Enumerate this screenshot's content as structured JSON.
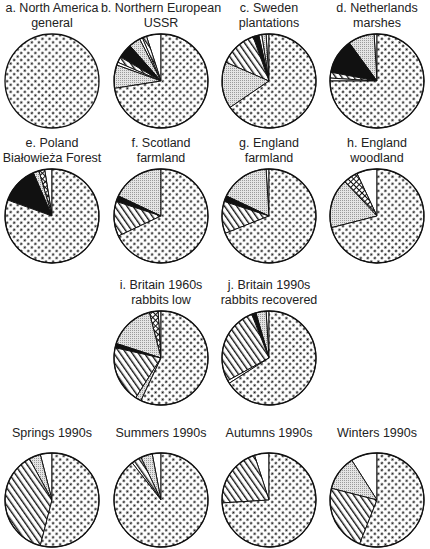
{
  "figure": {
    "legend_note": "Pie segments distinguished by fill pattern only; no legend shown in image.",
    "patterns": {
      "dots": "dense dot stipple (dominant category)",
      "fine": "fine grey stipple",
      "hatch": "diagonal hatch",
      "black": "solid black",
      "cross": "cross-hatch",
      "white": "plain white"
    }
  },
  "chart_data": {
    "type": "pie",
    "title": "",
    "layout": "grid of small-multiple pie charts; slices listed counter-clockwise from 12 o'clock, dotted slice completing the circle clockwise",
    "pies": [
      {
        "id": "a",
        "title_line1": "a. North America",
        "title_line2": "general",
        "cx": 52,
        "cy": 81,
        "slices": [
          {
            "pattern": "dots",
            "value": 100
          }
        ]
      },
      {
        "id": "b",
        "title_line1": "b. Northern European",
        "title_line2": "USSR",
        "cx": 161,
        "cy": 81,
        "slices": [
          {
            "pattern": "white",
            "value": 5
          },
          {
            "pattern": "hatch",
            "value": 1.5
          },
          {
            "pattern": "white",
            "value": 1
          },
          {
            "pattern": "fine",
            "value": 4
          },
          {
            "pattern": "black",
            "value": 5
          },
          {
            "pattern": "hatch",
            "value": 2
          },
          {
            "pattern": "white",
            "value": 1
          },
          {
            "pattern": "fine",
            "value": 8
          },
          {
            "pattern": "dots",
            "value": 72.5
          }
        ]
      },
      {
        "id": "c",
        "title_line1": "c. Sweden",
        "title_line2": "plantations",
        "cx": 269,
        "cy": 81,
        "slices": [
          {
            "pattern": "white",
            "value": 1
          },
          {
            "pattern": "fine",
            "value": 1.5
          },
          {
            "pattern": "white",
            "value": 1
          },
          {
            "pattern": "black",
            "value": 2
          },
          {
            "pattern": "hatch",
            "value": 13
          },
          {
            "pattern": "fine",
            "value": 16
          },
          {
            "pattern": "dots",
            "value": 65.5
          }
        ]
      },
      {
        "id": "d",
        "title_line1": "d. Netherlands",
        "title_line2": "marshes",
        "cx": 377,
        "cy": 81,
        "slices": [
          {
            "pattern": "white",
            "value": 1
          },
          {
            "pattern": "fine",
            "value": 9
          },
          {
            "pattern": "black",
            "value": 12
          },
          {
            "pattern": "hatch",
            "value": 2
          },
          {
            "pattern": "white",
            "value": 1
          },
          {
            "pattern": "dots",
            "value": 75
          }
        ]
      },
      {
        "id": "e",
        "title_line1": "e. Poland",
        "title_line2": "Białowieża Forest",
        "cx": 52,
        "cy": 216,
        "slices": [
          {
            "pattern": "white",
            "value": 2.5
          },
          {
            "pattern": "cross",
            "value": 2
          },
          {
            "pattern": "fine",
            "value": 2
          },
          {
            "pattern": "black",
            "value": 13
          },
          {
            "pattern": "dots",
            "value": 80.5
          }
        ]
      },
      {
        "id": "f",
        "title_line1": "f. Scotland",
        "title_line2": "farmland",
        "cx": 161,
        "cy": 216,
        "slices": [
          {
            "pattern": "fine",
            "value": 18
          },
          {
            "pattern": "black",
            "value": 2
          },
          {
            "pattern": "hatch",
            "value": 12
          },
          {
            "pattern": "dots",
            "value": 68
          }
        ]
      },
      {
        "id": "g",
        "title_line1": "g. England",
        "title_line2": "farmland",
        "cx": 269,
        "cy": 216,
        "slices": [
          {
            "pattern": "white",
            "value": 1
          },
          {
            "pattern": "fine",
            "value": 17
          },
          {
            "pattern": "black",
            "value": 2
          },
          {
            "pattern": "hatch",
            "value": 11
          },
          {
            "pattern": "dots",
            "value": 69
          }
        ]
      },
      {
        "id": "h",
        "title_line1": "h. England",
        "title_line2": "woodland",
        "cx": 377,
        "cy": 216,
        "slices": [
          {
            "pattern": "white",
            "value": 7
          },
          {
            "pattern": "cross",
            "value": 5
          },
          {
            "pattern": "fine",
            "value": 17
          },
          {
            "pattern": "dots",
            "value": 71
          }
        ]
      },
      {
        "id": "i",
        "title_line1": "i. Britain 1960s",
        "title_line2": "rabbits low",
        "cx": 161,
        "cy": 358,
        "slices": [
          {
            "pattern": "white",
            "value": 1
          },
          {
            "pattern": "cross",
            "value": 3
          },
          {
            "pattern": "fine",
            "value": 16
          },
          {
            "pattern": "black",
            "value": 1.5
          },
          {
            "pattern": "hatch",
            "value": 19.5
          },
          {
            "pattern": "fine",
            "value": 2
          },
          {
            "pattern": "dots",
            "value": 57
          }
        ]
      },
      {
        "id": "j",
        "title_line1": "j. Britain 1990s",
        "title_line2": "rabbits recovered",
        "cx": 269,
        "cy": 358,
        "slices": [
          {
            "pattern": "white",
            "value": 1
          },
          {
            "pattern": "fine",
            "value": 3.5
          },
          {
            "pattern": "black",
            "value": 1.5
          },
          {
            "pattern": "hatch",
            "value": 27
          },
          {
            "pattern": "white",
            "value": 1
          },
          {
            "pattern": "dots",
            "value": 66
          }
        ]
      },
      {
        "id": "spring",
        "title_line1": "Springs 1990s",
        "title_line2": "",
        "cx": 52,
        "cy": 500,
        "slices": [
          {
            "pattern": "white",
            "value": 4
          },
          {
            "pattern": "fine",
            "value": 4
          },
          {
            "pattern": "hatch",
            "value": 38
          },
          {
            "pattern": "dots",
            "value": 54
          }
        ]
      },
      {
        "id": "summer",
        "title_line1": "Summers 1990s",
        "title_line2": "",
        "cx": 161,
        "cy": 500,
        "slices": [
          {
            "pattern": "white",
            "value": 3
          },
          {
            "pattern": "fine",
            "value": 4
          },
          {
            "pattern": "hatch",
            "value": 3.5
          },
          {
            "pattern": "dots",
            "value": 89.5
          }
        ]
      },
      {
        "id": "autumn",
        "title_line1": "Autumns 1990s",
        "title_line2": "",
        "cx": 269,
        "cy": 500,
        "slices": [
          {
            "pattern": "white",
            "value": 5
          },
          {
            "pattern": "hatch",
            "value": 21
          },
          {
            "pattern": "dots",
            "value": 74
          }
        ]
      },
      {
        "id": "winter",
        "title_line1": "Winters 1990s",
        "title_line2": "",
        "cx": 377,
        "cy": 500,
        "slices": [
          {
            "pattern": "white",
            "value": 9
          },
          {
            "pattern": "fine",
            "value": 12
          },
          {
            "pattern": "hatch",
            "value": 23
          },
          {
            "pattern": "dots",
            "value": 56
          }
        ]
      }
    ],
    "radius": 47
  }
}
